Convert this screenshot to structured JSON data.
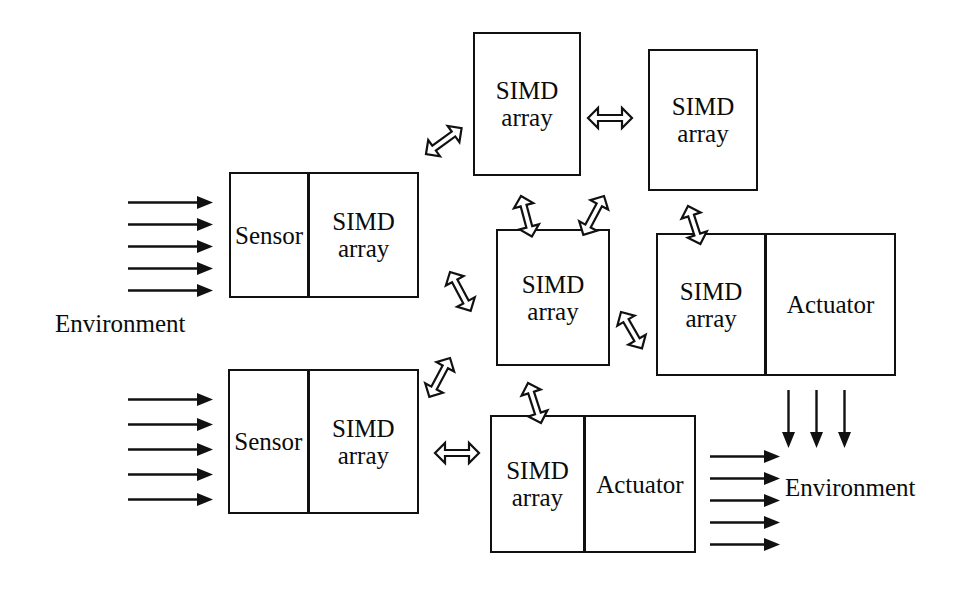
{
  "diagram": {
    "stroke_color": "#111111",
    "text_color": "#0b0b0b",
    "background_color": "#ffffff",
    "labels": {
      "simd_array": "SIMD\narray",
      "simd": "SIMD",
      "array": "array",
      "sensor": "Sensor",
      "actuator": "Actuator",
      "environment_left": "Environment",
      "environment_right": "Environment"
    },
    "nodes": [
      {
        "id": "simd-top-left",
        "kind": "simd-array",
        "cells": [
          {
            "label": "SIMD\narray",
            "name": "simd-array-cell"
          }
        ],
        "x": 473,
        "y": 32,
        "w": 108,
        "h": 144
      },
      {
        "id": "simd-top-right",
        "kind": "simd-array",
        "cells": [
          {
            "label": "SIMD\narray",
            "name": "simd-array-cell"
          }
        ],
        "x": 648,
        "y": 49,
        "w": 110,
        "h": 142
      },
      {
        "id": "sensor-top-left",
        "kind": "sensor-simd",
        "cells": [
          {
            "label": "Sensor",
            "name": "sensor-cell"
          },
          {
            "label": "SIMD\narray",
            "name": "simd-array-cell"
          }
        ],
        "x": 229,
        "y": 172,
        "w": 190,
        "h": 126
      },
      {
        "id": "simd-center",
        "kind": "simd-array",
        "cells": [
          {
            "label": "SIMD\narray",
            "name": "simd-array-cell"
          }
        ],
        "x": 496,
        "y": 229,
        "w": 114,
        "h": 137
      },
      {
        "id": "simd-actuator-right",
        "kind": "simd-actuator",
        "cells": [
          {
            "label": "SIMD\narray",
            "name": "simd-array-cell"
          },
          {
            "label": "Actuator",
            "name": "actuator-cell"
          }
        ],
        "x": 656,
        "y": 233,
        "w": 240,
        "h": 143
      },
      {
        "id": "sensor-bottom-left",
        "kind": "sensor-simd",
        "cells": [
          {
            "label": "Sensor",
            "name": "sensor-cell"
          },
          {
            "label": "SIMD\narray",
            "name": "simd-array-cell"
          }
        ],
        "x": 228,
        "y": 369,
        "w": 191,
        "h": 145
      },
      {
        "id": "simd-actuator-bottom",
        "kind": "simd-actuator",
        "cells": [
          {
            "label": "SIMD\narray",
            "name": "simd-array-cell"
          },
          {
            "label": "Actuator",
            "name": "actuator-cell"
          }
        ],
        "x": 490,
        "y": 415,
        "w": 206,
        "h": 138
      }
    ],
    "links": [
      {
        "id": "link-topleft-topright",
        "from": "simd-top-left",
        "to": "simd-top-right",
        "x": 588,
        "y": 108,
        "angle": 0,
        "len": 44,
        "name": "double-arrow-horizontal"
      },
      {
        "id": "link-sensor-topleft",
        "from": "sensor-top-left",
        "to": "simd-top-left",
        "x": 426,
        "y": 144,
        "angle": -36,
        "len": 44,
        "name": "double-arrow-diagonal"
      },
      {
        "id": "link-topleft-center",
        "from": "simd-top-left",
        "to": "simd-center",
        "x": 521,
        "y": 186,
        "angle": 75,
        "len": 42,
        "name": "double-arrow-vertical"
      },
      {
        "id": "link-topright-center",
        "from": "simd-top-right",
        "to": "simd-center",
        "x": 604,
        "y": 186,
        "angle": 118,
        "len": 44,
        "name": "double-arrow-diagonal"
      },
      {
        "id": "link-topright-rightnode",
        "from": "simd-top-right",
        "to": "simd-actuator-right",
        "x": 688,
        "y": 196,
        "angle": 72,
        "len": 40,
        "name": "double-arrow-vertical"
      },
      {
        "id": "link-sensor-center",
        "from": "sensor-top-left",
        "to": "simd-center",
        "x": 450,
        "y": 262,
        "angle": 62,
        "len": 44,
        "name": "double-arrow-diagonal"
      },
      {
        "id": "link-center-rightnode",
        "from": "simd-center",
        "to": "simd-actuator-right",
        "x": 621,
        "y": 302,
        "angle": 60,
        "len": 42,
        "name": "double-arrow-diagonal"
      },
      {
        "id": "link-center-sensorbottom",
        "from": "simd-center",
        "to": "sensor-bottom-left",
        "x": 450,
        "y": 348,
        "angle": 118,
        "len": 44,
        "name": "double-arrow-diagonal"
      },
      {
        "id": "link-center-bottomnode",
        "from": "simd-center",
        "to": "simd-actuator-bottom",
        "x": 528,
        "y": 373,
        "angle": 72,
        "len": 42,
        "name": "double-arrow-vertical"
      },
      {
        "id": "link-sensorbottom-bottomnode",
        "from": "sensor-bottom-left",
        "to": "simd-actuator-bottom",
        "x": 435,
        "y": 443,
        "angle": 0,
        "len": 44,
        "name": "double-arrow-horizontal"
      }
    ],
    "flows": [
      {
        "id": "env-in-top",
        "name": "environment-input-arrows-top",
        "direction": "right",
        "count": 5,
        "x": 128,
        "y": 196,
        "length": 85,
        "spacing": 22
      },
      {
        "id": "env-in-bottom",
        "name": "environment-input-arrows-bottom",
        "direction": "right",
        "count": 5,
        "x": 128,
        "y": 393,
        "length": 85,
        "spacing": 25
      },
      {
        "id": "env-out-right",
        "name": "environment-output-arrows-right",
        "direction": "down",
        "count": 3,
        "x": 782,
        "y": 390,
        "length": 58,
        "spacing": 28
      },
      {
        "id": "env-out-bottom",
        "name": "environment-output-arrows-bottom",
        "direction": "right",
        "count": 5,
        "x": 710,
        "y": 450,
        "length": 70,
        "spacing": 22
      }
    ],
    "texts": [
      {
        "id": "env-left",
        "label": "Environment",
        "x": 55,
        "y": 310,
        "name": "environment-label-left"
      },
      {
        "id": "env-right",
        "label": "Environment",
        "x": 785,
        "y": 474,
        "name": "environment-label-right"
      }
    ]
  }
}
